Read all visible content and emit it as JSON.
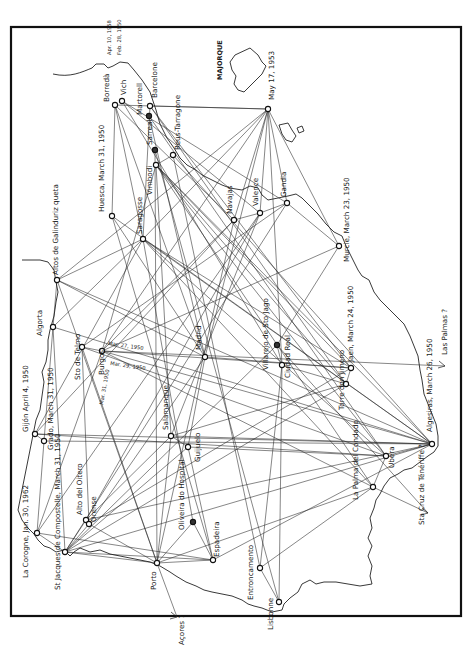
{
  "map": {
    "title": "",
    "region_label": "MAJORQUE",
    "colors": {
      "ink": "#1a1a1a",
      "paper": "#ffffff"
    },
    "nodes": [
      {
        "id": "borreda",
        "label": "Borredà",
        "x": 115,
        "y": 105,
        "lx": 109,
        "ly": 102,
        "rot": -90
      },
      {
        "id": "vich",
        "label": "Vich",
        "x": 122,
        "y": 101,
        "lx": 126,
        "ly": 95,
        "rot": -90
      },
      {
        "id": "barcelone",
        "label": "Barcelone",
        "x": 150,
        "y": 106,
        "lx": 157,
        "ly": 98,
        "rot": -90
      },
      {
        "id": "martorell",
        "label": "Martorell",
        "x": 149,
        "y": 116,
        "lx": 142,
        "ly": 115,
        "rot": -90,
        "filled": true
      },
      {
        "id": "reus",
        "label": "Reus-Tarragone",
        "x": 173,
        "y": 155,
        "lx": 180,
        "ly": 150,
        "rot": -90
      },
      {
        "id": "sarreal",
        "label": "Sarreal",
        "x": 155,
        "y": 150,
        "lx": 152,
        "ly": 145,
        "rot": -90,
        "filled": true
      },
      {
        "id": "vimbodi",
        "label": "Vimbodi",
        "x": 156,
        "y": 165,
        "lx": 152,
        "ly": 195,
        "rot": -90
      },
      {
        "id": "huesca",
        "label": "Huesca, March 31, 1950",
        "x": 112,
        "y": 216,
        "lx": 104,
        "ly": 212,
        "rot": -90
      },
      {
        "id": "saragosse",
        "label": "Saragosse",
        "x": 143,
        "y": 239,
        "lx": 142,
        "ly": 234,
        "rot": -90
      },
      {
        "id": "navajas",
        "label": "Navajas",
        "x": 234,
        "y": 220,
        "lx": 232,
        "ly": 214,
        "rot": -90
      },
      {
        "id": "valence",
        "label": "Valence",
        "x": 260,
        "y": 213,
        "lx": 258,
        "ly": 206,
        "rot": -90
      },
      {
        "id": "gandia",
        "label": "Gandia",
        "x": 287,
        "y": 203,
        "lx": 286,
        "ly": 197,
        "rot": -90
      },
      {
        "id": "may17",
        "label": "May 17, 1953",
        "x": 268,
        "y": 109,
        "lx": 274,
        "ly": 100,
        "rot": -90
      },
      {
        "id": "murcie",
        "label": "Murcie, March 23, 1950",
        "x": 339,
        "y": 246,
        "lx": 349,
        "ly": 262,
        "rot": -90
      },
      {
        "id": "altos",
        "label": "Altos de Galinduriz queta",
        "x": 57,
        "y": 280,
        "lx": 58,
        "ly": 275,
        "rot": -90
      },
      {
        "id": "algorta",
        "label": "Algorta",
        "x": 53,
        "y": 327,
        "lx": 42,
        "ly": 336,
        "rot": -90
      },
      {
        "id": "stotelmo",
        "label": "Sto de Telmo",
        "x": 82,
        "y": 347,
        "lx": 80,
        "ly": 380,
        "rot": -90
      },
      {
        "id": "burgos",
        "label": "Burgos",
        "x": 102,
        "y": 351,
        "lx": 104,
        "ly": 375,
        "rot": -90
      },
      {
        "id": "madrid",
        "label": "Madrid",
        "x": 205,
        "y": 357,
        "lx": 201,
        "ly": 350,
        "rot": -90
      },
      {
        "id": "villarejo",
        "label": "Villarejo de Sto Jago",
        "x": 277,
        "y": 345,
        "lx": 268,
        "ly": 370,
        "rot": -90,
        "filled": true
      },
      {
        "id": "ciudadreal",
        "label": "Ciudad Real",
        "x": 282,
        "y": 365,
        "lx": 290,
        "ly": 378,
        "rot": -90
      },
      {
        "id": "jaen",
        "label": "Jaen, March 24, 1950",
        "x": 351,
        "y": 368,
        "lx": 353,
        "ly": 362,
        "rot": -90
      },
      {
        "id": "torredon",
        "label": "Torre don Jimeno",
        "x": 346,
        "y": 384,
        "lx": 344,
        "ly": 410,
        "rot": -90
      },
      {
        "id": "lasPalmas",
        "label": "Las Palmas ?",
        "x": 445,
        "y": 366,
        "lx": 447,
        "ly": 355,
        "rot": -90,
        "arrow": true
      },
      {
        "id": "gijon",
        "label": "Gijón  April 4, 1950",
        "x": 35,
        "y": 434,
        "lx": 28,
        "ly": 432,
        "rot": -90
      },
      {
        "id": "grado",
        "label": "Grado, March 31, 1950",
        "x": 44,
        "y": 441,
        "lx": 53,
        "ly": 450,
        "rot": -90
      },
      {
        "id": "salamanque",
        "label": "Salamanque",
        "x": 171,
        "y": 436,
        "lx": 168,
        "ly": 430,
        "rot": -90
      },
      {
        "id": "guijuelo",
        "label": "Guijuelo",
        "x": 188,
        "y": 447,
        "lx": 200,
        "ly": 462,
        "rot": -90
      },
      {
        "id": "altodelo",
        "label": "Alto del Oitero",
        "x": 86,
        "y": 520,
        "lx": 82,
        "ly": 515,
        "rot": -90
      },
      {
        "id": "orense",
        "label": "Orense",
        "x": 89,
        "y": 524,
        "lx": 96,
        "ly": 522,
        "rot": -90
      },
      {
        "id": "oliveira",
        "label": "Oliveira do Hospital",
        "x": 193,
        "y": 522,
        "lx": 184,
        "ly": 530,
        "rot": -90,
        "filled": true
      },
      {
        "id": "espadeira",
        "label": "Espadeira",
        "x": 213,
        "y": 560,
        "lx": 219,
        "ly": 557,
        "rot": -90
      },
      {
        "id": "lacoruna",
        "label": "La Corogne, Jan. 30, 1962",
        "x": 37,
        "y": 533,
        "lx": 28,
        "ly": 578,
        "rot": -90
      },
      {
        "id": "compostelle",
        "label": "St Jacques de Compostelle, March 31, 1950",
        "x": 65,
        "y": 552,
        "lx": 60,
        "ly": 590,
        "rot": -90
      },
      {
        "id": "porto",
        "label": "Porto",
        "x": 157,
        "y": 563,
        "lx": 156,
        "ly": 590,
        "rot": -90
      },
      {
        "id": "acores",
        "label": "Açores ?",
        "x": 177,
        "y": 617,
        "lx": 184,
        "ly": 645,
        "rot": -90,
        "arrow": true
      },
      {
        "id": "entroncamento",
        "label": "Entroncamento",
        "x": 260,
        "y": 568,
        "lx": 253,
        "ly": 600,
        "rot": -90
      },
      {
        "id": "lisbonne",
        "label": "Lisbonne",
        "x": 279,
        "y": 602,
        "lx": 273,
        "ly": 630,
        "rot": -90
      },
      {
        "id": "lapalma",
        "label": "La Palma del Condado",
        "x": 373,
        "y": 487,
        "lx": 358,
        "ly": 500,
        "rot": -90
      },
      {
        "id": "ubera",
        "label": "Ubera",
        "x": 386,
        "y": 456,
        "lx": 394,
        "ly": 468,
        "rot": -90
      },
      {
        "id": "algesiras",
        "label": "Algesiras, March 26, 1950",
        "x": 432,
        "y": 444,
        "lx": 432,
        "ly": 432,
        "rot": -90
      },
      {
        "id": "tenerife",
        "label": "Sta Cruz de Ténériffe ?",
        "x": 428,
        "y": 513,
        "lx": 424,
        "ly": 525,
        "rot": -90,
        "arrow": true
      }
    ],
    "small_labels": [
      {
        "text": "Apr. 10, 1958",
        "x": 111,
        "y": 55,
        "rot": -90
      },
      {
        "text": "Feb. 28, 1950",
        "x": 121,
        "y": 55,
        "rot": -90
      },
      {
        "text": "Mar. 27, 1950",
        "x": 108,
        "y": 345,
        "rot": 8
      },
      {
        "text": "Mar. 29, 1950",
        "x": 110,
        "y": 365,
        "rot": 8
      },
      {
        "text": "Mar. 31, 1950",
        "x": 103,
        "y": 405,
        "rot": -80
      }
    ],
    "links": [
      [
        "borreda",
        "may17"
      ],
      [
        "borreda",
        "huesca"
      ],
      [
        "borreda",
        "saragosse"
      ],
      [
        "borreda",
        "navajas"
      ],
      [
        "borreda",
        "madrid"
      ],
      [
        "vich",
        "valence"
      ],
      [
        "vich",
        "ciudadreal"
      ],
      [
        "vich",
        "gandia"
      ],
      [
        "barcelone",
        "may17"
      ],
      [
        "barcelone",
        "torredon"
      ],
      [
        "barcelone",
        "saragosse"
      ],
      [
        "barcelone",
        "jaen"
      ],
      [
        "martorell",
        "ubera"
      ],
      [
        "martorell",
        "madrid"
      ],
      [
        "reus",
        "vimbodi"
      ],
      [
        "reus",
        "entroncamento"
      ],
      [
        "reus",
        "algesiras"
      ],
      [
        "sarreal",
        "lisbonne"
      ],
      [
        "sarreal",
        "porto"
      ],
      [
        "vimbodi",
        "algesiras"
      ],
      [
        "vimbodi",
        "lapalma"
      ],
      [
        "vimbodi",
        "ubera"
      ],
      [
        "vimbodi",
        "torredon"
      ],
      [
        "vimbodi",
        "jaen"
      ],
      [
        "vimbodi",
        "burgos"
      ],
      [
        "vimbodi",
        "salamanque"
      ],
      [
        "may17",
        "navajas"
      ],
      [
        "may17",
        "valence"
      ],
      [
        "may17",
        "gandia"
      ],
      [
        "may17",
        "ciudadreal"
      ],
      [
        "may17",
        "murcie"
      ],
      [
        "may17",
        "altos"
      ],
      [
        "may17",
        "burgos"
      ],
      [
        "may17",
        "saragosse"
      ],
      [
        "may17",
        "madrid"
      ],
      [
        "huesca",
        "madrid"
      ],
      [
        "huesca",
        "espadeira"
      ],
      [
        "huesca",
        "algesiras"
      ],
      [
        "saragosse",
        "altos"
      ],
      [
        "saragosse",
        "algorta"
      ],
      [
        "saragosse",
        "gijon"
      ],
      [
        "saragosse",
        "oliveira"
      ],
      [
        "saragosse",
        "lapalma"
      ],
      [
        "saragosse",
        "ubera"
      ],
      [
        "saragosse",
        "algesiras"
      ],
      [
        "saragosse",
        "jaen"
      ],
      [
        "navajas",
        "valence"
      ],
      [
        "navajas",
        "burgos"
      ],
      [
        "navajas",
        "gijon"
      ],
      [
        "navajas",
        "porto"
      ],
      [
        "valence",
        "gandia"
      ],
      [
        "valence",
        "salamanque"
      ],
      [
        "valence",
        "altodelo"
      ],
      [
        "valence",
        "lacoruna"
      ],
      [
        "gandia",
        "murcie"
      ],
      [
        "gandia",
        "stotelmo"
      ],
      [
        "gandia",
        "compostelle"
      ],
      [
        "murcie",
        "burgos"
      ],
      [
        "murcie",
        "villarejo"
      ],
      [
        "altos",
        "algorta"
      ],
      [
        "altos",
        "madrid"
      ],
      [
        "altos",
        "porto"
      ],
      [
        "altos",
        "algesiras"
      ],
      [
        "algorta",
        "grado"
      ],
      [
        "algorta",
        "compostelle"
      ],
      [
        "algorta",
        "algesiras"
      ],
      [
        "stotelmo",
        "burgos"
      ],
      [
        "stotelmo",
        "porto"
      ],
      [
        "stotelmo",
        "ubera"
      ],
      [
        "stotelmo",
        "orense"
      ],
      [
        "burgos",
        "algesiras"
      ],
      [
        "burgos",
        "lacoruna"
      ],
      [
        "burgos",
        "lapalma"
      ],
      [
        "burgos",
        "jaen"
      ],
      [
        "burgos",
        "lasPalmas"
      ],
      [
        "madrid",
        "guijuelo"
      ],
      [
        "madrid",
        "jaen"
      ],
      [
        "madrid",
        "orense"
      ],
      [
        "villarejo",
        "ciudadreal"
      ],
      [
        "villarejo",
        "tenerife"
      ],
      [
        "villarejo",
        "compostelle"
      ],
      [
        "ciudadreal",
        "torredon"
      ],
      [
        "ciudadreal",
        "lisbonne"
      ],
      [
        "ciudadreal",
        "entroncamento"
      ],
      [
        "jaen",
        "torredon"
      ],
      [
        "jaen",
        "orense"
      ],
      [
        "torredon",
        "salamanque"
      ],
      [
        "torredon",
        "compostelle"
      ],
      [
        "gijon",
        "grado"
      ],
      [
        "gijon",
        "algesiras"
      ],
      [
        "gijon",
        "ubera"
      ],
      [
        "grado",
        "lacoruna"
      ],
      [
        "grado",
        "algesiras"
      ],
      [
        "salamanque",
        "guijuelo"
      ],
      [
        "salamanque",
        "altodelo"
      ],
      [
        "salamanque",
        "algesiras"
      ],
      [
        "salamanque",
        "porto"
      ],
      [
        "guijuelo",
        "espadeira"
      ],
      [
        "guijuelo",
        "ubera"
      ],
      [
        "guijuelo",
        "compostelle"
      ],
      [
        "altodelo",
        "orense"
      ],
      [
        "altodelo",
        "compostelle"
      ],
      [
        "altodelo",
        "algesiras"
      ],
      [
        "orense",
        "porto"
      ],
      [
        "orense",
        "compostelle"
      ],
      [
        "oliveira",
        "espadeira"
      ],
      [
        "oliveira",
        "porto"
      ],
      [
        "espadeira",
        "compostelle"
      ],
      [
        "espadeira",
        "algesiras"
      ],
      [
        "lacoruna",
        "compostelle"
      ],
      [
        "lacoruna",
        "espadeira"
      ],
      [
        "compostelle",
        "porto"
      ],
      [
        "compostelle",
        "algesiras"
      ],
      [
        "porto",
        "acores"
      ],
      [
        "porto",
        "espadeira"
      ],
      [
        "porto",
        "lapalma"
      ],
      [
        "entroncamento",
        "lisbonne"
      ],
      [
        "entroncamento",
        "lapalma"
      ],
      [
        "ubera",
        "algesiras"
      ],
      [
        "lapalma",
        "tenerife"
      ],
      [
        "lapalma",
        "ubera"
      ]
    ]
  }
}
